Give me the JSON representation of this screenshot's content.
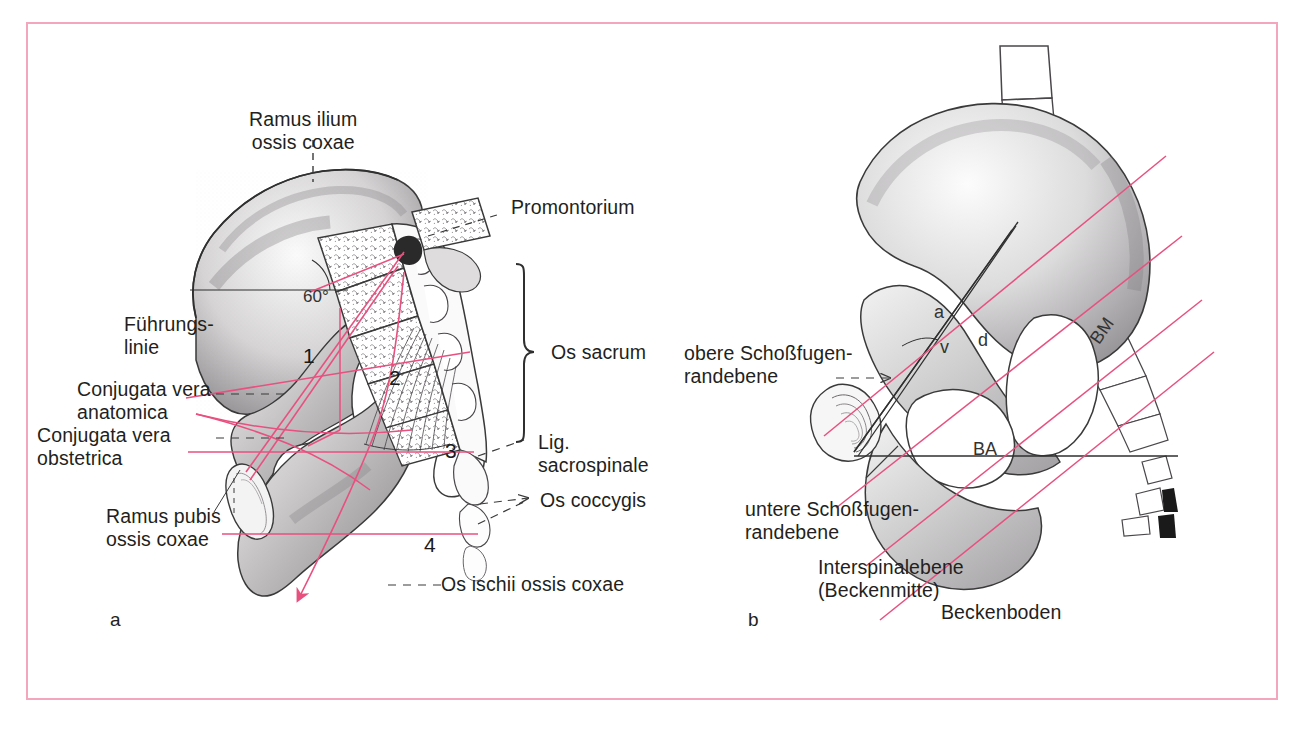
{
  "figure": {
    "frame_color": "#f4a6bc",
    "line_color_red": "#e8507f",
    "ink_color": "#231f20"
  },
  "panel_a": {
    "letter": "a",
    "angle_label": "60°",
    "labels": {
      "ramus_ilium": "Ramus ilium\nossis coxae",
      "fuehrungslinie": "Führungs-\nlinie",
      "conjugata_anatomica": "Conjugata vera\nanatomica",
      "conjugata_obstetrica": "Conjugata vera\nobstetrica",
      "ramus_pubis": "Ramus pubis\nossis coxae",
      "promontorium": "Promontorium",
      "os_sacrum": "Os sacrum",
      "lig_sacrospinale": "Lig.\nsacrospinale",
      "os_coccygis": "Os coccygis",
      "os_ischii": "Os ischii ossis coxae"
    },
    "numbers": [
      "1",
      "2",
      "3",
      "4"
    ]
  },
  "panel_b": {
    "letter": "b",
    "labels": {
      "obere_schossfugenrandebene": "obere Schoßfugen-\nrandebene",
      "untere_schossfugenrandebene": "untere Schoßfugen-\nrandebene",
      "interspinalebene": "Interspinalebene\n(Beckenmitte)",
      "beckenboden": "Beckenboden"
    },
    "inline_marks": [
      "a",
      "v",
      "d",
      "BM",
      "BA"
    ]
  }
}
